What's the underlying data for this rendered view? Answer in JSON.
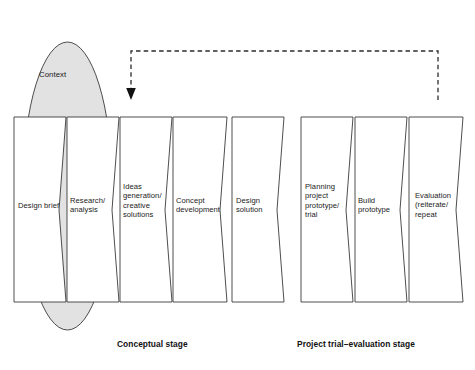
{
  "figure": {
    "background_color": "#ffffff",
    "stroke_color": "#3a3a3a",
    "ellipse_fill": "#e2e2e2",
    "box_fill": "#ffffff",
    "text_color": "#1a1a1a"
  },
  "context": {
    "label": "Context"
  },
  "feedback_arrow": {
    "name": "feedback-loop-arrow",
    "style": "dashed"
  },
  "stages": [
    {
      "id": "design-brief",
      "label": "Design brief",
      "group": "conceptual",
      "x": 14,
      "width": 52,
      "label_x": 18,
      "label_y": 201
    },
    {
      "id": "research-analysis",
      "label": "Research/\nanalysis",
      "group": "conceptual",
      "x": 67,
      "width": 52,
      "label_x": 70,
      "label_y": 196
    },
    {
      "id": "ideas-generation",
      "label": "Ideas\ngeneration/\ncreative\nsolutions",
      "group": "conceptual",
      "x": 120,
      "width": 52,
      "label_x": 123,
      "label_y": 182
    },
    {
      "id": "concept-development",
      "label": "Concept\ndevelopment",
      "group": "conceptual",
      "x": 173,
      "width": 54,
      "label_x": 176,
      "label_y": 196
    },
    {
      "id": "design-solution",
      "label": "Design\nsolution",
      "group": "conceptual",
      "x": 232,
      "width": 52,
      "label_x": 236,
      "label_y": 196
    },
    {
      "id": "planning-project-prototype-trial",
      "label": "Planning\nproject\nprototype/\ntrial",
      "group": "trial",
      "x": 301,
      "width": 52,
      "label_x": 305,
      "label_y": 182
    },
    {
      "id": "build-prototype",
      "label": "Build\nprototype",
      "group": "trial",
      "x": 355,
      "width": 52,
      "label_x": 358,
      "label_y": 196
    },
    {
      "id": "evaluation-reiterate-repeat",
      "label": "Evaluation\n(reiterate/\nrepeat",
      "group": "trial",
      "x": 409,
      "width": 54,
      "label_x": 415,
      "label_y": 191
    }
  ],
  "captions": [
    {
      "id": "conceptual-stage-caption",
      "label": "Conceptual stage",
      "x": 117,
      "y": 339
    },
    {
      "id": "project-trial-evaluation-stage-caption",
      "label": "Project trial–evaluation stage",
      "x": 297,
      "y": 339
    }
  ]
}
